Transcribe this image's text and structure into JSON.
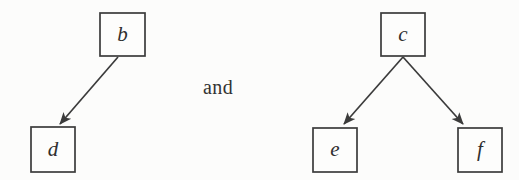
{
  "figure": {
    "background_color": "#fcfcfb",
    "ink_color": "#3b3b3b",
    "caption_text": "and",
    "graphs": [
      {
        "id": "left-graph",
        "nodes": [
          {
            "id": "b",
            "label": "b",
            "x": 100,
            "y": 13,
            "w": 45,
            "h": 43,
            "cx": 122.5,
            "cy": 34.5
          },
          {
            "id": "d",
            "label": "d",
            "x": 31,
            "y": 127,
            "w": 44,
            "h": 45,
            "cx": 53.0,
            "cy": 149.5
          }
        ],
        "edges": [
          {
            "id": "b-to-d",
            "from": "b",
            "to": "d",
            "x1": 118,
            "y1": 57,
            "x2": 60,
            "y2": 124
          }
        ]
      },
      {
        "id": "right-graph",
        "nodes": [
          {
            "id": "c",
            "label": "c",
            "x": 381,
            "y": 13,
            "w": 44,
            "h": 43,
            "cx": 403.0,
            "cy": 34.5
          },
          {
            "id": "e",
            "label": "e",
            "x": 313,
            "y": 128,
            "w": 44,
            "h": 44,
            "cx": 335.0,
            "cy": 150.0
          },
          {
            "id": "f",
            "label": "f",
            "x": 458,
            "y": 128,
            "w": 44,
            "h": 44,
            "cx": 480.0,
            "cy": 150.0
          }
        ],
        "edges": [
          {
            "id": "c-to-e",
            "from": "c",
            "to": "e",
            "x1": 403,
            "y1": 57,
            "x2": 344,
            "y2": 124
          },
          {
            "id": "c-to-f",
            "from": "c",
            "to": "f",
            "x1": 403,
            "y1": 57,
            "x2": 463,
            "y2": 124
          }
        ]
      }
    ],
    "conjunction": {
      "x": 218,
      "y": 88
    }
  }
}
